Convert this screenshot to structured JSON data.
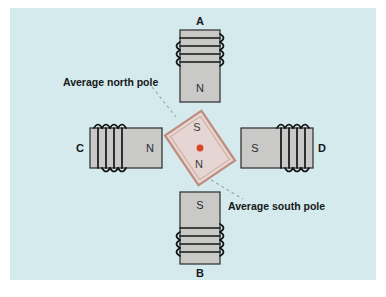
{
  "figure": {
    "background_color": "#d4eaec",
    "page_color": "#ffffff",
    "core_color": "#c9c9c7",
    "magnet_fill": "#e6d6d3",
    "magnet_stroke": "#c08b7d",
    "pivot_color": "#d9442a",
    "leader_color": "#9aa8a8"
  },
  "electromagnets": [
    {
      "id": "A",
      "label": "A",
      "pole_label": "N",
      "position": "top",
      "orientation": "vertical",
      "coil_side": "top",
      "label_position": "above"
    },
    {
      "id": "B",
      "label": "B",
      "pole_label": "S",
      "position": "bottom",
      "orientation": "vertical",
      "coil_side": "bottom",
      "label_position": "below"
    },
    {
      "id": "C",
      "label": "C",
      "pole_label": "N",
      "position": "left",
      "orientation": "horizontal",
      "coil_side": "left",
      "label_position": "left"
    },
    {
      "id": "D",
      "label": "D",
      "pole_label": "S",
      "position": "right",
      "orientation": "horizontal",
      "coil_side": "right",
      "label_position": "right"
    }
  ],
  "rotor_magnet": {
    "north_label": "N",
    "south_label": "S",
    "rotation_degrees": 56,
    "pivot": "red-dot"
  },
  "callouts": [
    {
      "id": "north",
      "text": "Average north pole",
      "points_to": "rotor-south-end-upper-left"
    },
    {
      "id": "south",
      "text": "Average south pole",
      "points_to": "rotor-north-end-lower-right"
    }
  ]
}
